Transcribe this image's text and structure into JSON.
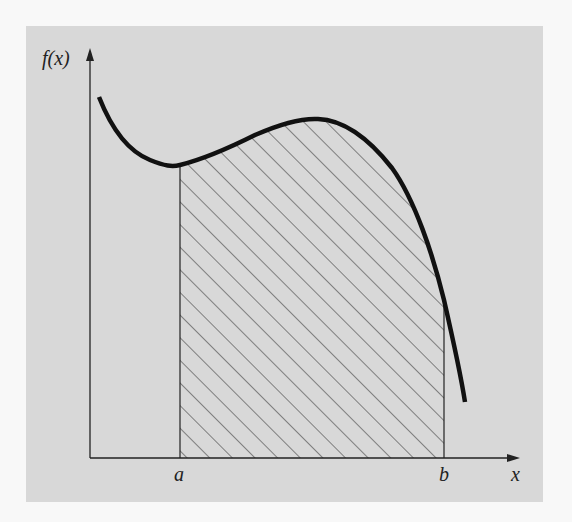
{
  "diagram": {
    "labels": {
      "y_axis": "f(x)",
      "x_axis": "x",
      "lower_bound": "a",
      "upper_bound": "b"
    },
    "colors": {
      "background": "#f8f8f8",
      "panel": "#d8d8d8",
      "curve": "#111111",
      "axes": "#222222",
      "hatch": "#333333"
    },
    "elements": [
      "y-axis with arrow labeled f(x)",
      "x-axis with arrow labeled x",
      "curve f(x) with local minimum near a and local maximum between a and b",
      "vertical line at a",
      "vertical line at b",
      "diagonally hatched region under curve between a and b"
    ]
  }
}
